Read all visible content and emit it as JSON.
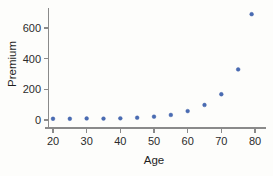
{
  "chart_data": {
    "type": "scatter",
    "title": "",
    "xlabel": "Age",
    "ylabel": "Premium",
    "x": [
      20,
      25,
      30,
      35,
      40,
      45,
      50,
      55,
      60,
      65,
      70,
      75,
      79
    ],
    "values": [
      8,
      8,
      10,
      9,
      11,
      15,
      22,
      33,
      58,
      98,
      168,
      330,
      690
    ],
    "series": [
      {
        "name": "Premium",
        "values": [
          8,
          8,
          10,
          9,
          11,
          15,
          22,
          33,
          58,
          98,
          168,
          330,
          690
        ]
      }
    ],
    "xlim": [
      17,
      82
    ],
    "ylim": [
      -30,
      720
    ],
    "xticks": [
      20,
      30,
      40,
      50,
      60,
      70,
      80
    ],
    "xtick_labels": [
      "20",
      "30",
      "40",
      "50",
      "60",
      "70",
      "80"
    ],
    "yticks": [
      0,
      200,
      400,
      600
    ],
    "ytick_labels": [
      "0",
      "200",
      "400",
      "600"
    ],
    "grid": false,
    "legend": false,
    "marker_color": "#4a6cb3",
    "axis_color": "#8a8a8a",
    "background_color": "#fdfdfb"
  }
}
